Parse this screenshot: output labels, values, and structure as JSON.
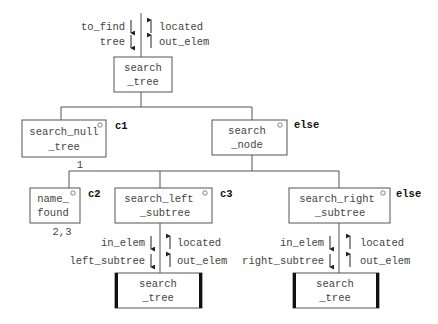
{
  "diagram": {
    "type": "structure-chart",
    "root": {
      "label_line1": "search",
      "label_line2": "_tree",
      "in_params": [
        "to_find",
        "tree"
      ],
      "out_params": [
        "located",
        "out_elem"
      ]
    },
    "level1": [
      {
        "id": "search_null_tree",
        "label_line1": "search_null",
        "label_line2": "_tree",
        "condition": "c1",
        "note": "1",
        "marker": "o"
      },
      {
        "id": "search_node",
        "label_line1": "search",
        "label_line2": "_node",
        "condition": "else",
        "marker": "o"
      }
    ],
    "level2": [
      {
        "id": "name_found",
        "label_line1": "name_",
        "label_line2": "found",
        "condition": "c2",
        "note": "2,3",
        "marker": "o"
      },
      {
        "id": "search_left_subtree",
        "label_line1": "search_left",
        "label_line2": "_subtree",
        "condition": "c3",
        "marker": "o",
        "in_params": [
          "in_elem",
          "left_subtree"
        ],
        "out_params": [
          "located",
          "out_elem"
        ],
        "child": {
          "label_line1": "search",
          "label_line2": "_tree",
          "recursive": true
        }
      },
      {
        "id": "search_right_subtree",
        "label_line1": "search_right",
        "label_line2": "_subtree",
        "condition": "else",
        "marker": "o",
        "in_params": [
          "in_elem",
          "right_subtree"
        ],
        "out_params": [
          "located",
          "out_elem"
        ],
        "child": {
          "label_line1": "search",
          "label_line2": "_tree",
          "recursive": true
        }
      }
    ]
  }
}
